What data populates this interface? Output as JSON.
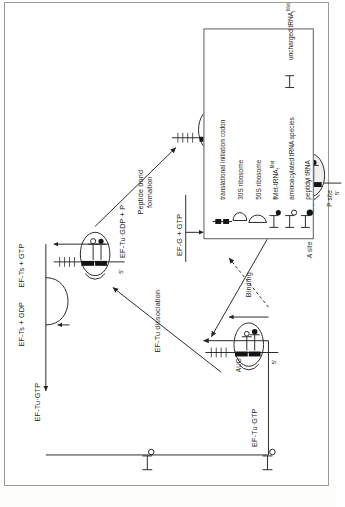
{
  "figure": {
    "orientation": "rotated-90"
  },
  "factors": {
    "ef_tu_gtp_top": "EF-Tu·GTP",
    "ef_ts_gdp": "EF-Ts + GDP",
    "ef_ts_gtp": "EF-Ts + GTP",
    "ef_tu_gdp_p": "EF-Tu·GDP + P",
    "ef_tu_gtp_left": "EF-Tu·GTP",
    "ef_g_gtp": "EF-G + GTP",
    "ef_tu_gdp_out": "EF-Tu +\nGDP"
  },
  "steps": {
    "binding": "Binding",
    "ef_tu_dissociation": "EF-Tu dissociation",
    "peptide_bond_formation": "Peptide bond\nformation",
    "translocation": "Translocation"
  },
  "ribosome_labels": {
    "aug": "AUG",
    "five_prime": "5'",
    "p_site": "P site",
    "a_site": "A site"
  },
  "legend": {
    "items": [
      {
        "symbol": "initiation-codon",
        "label": "translational initiation codon"
      },
      {
        "symbol": "30s-ribosome",
        "label": "30S ribosome"
      },
      {
        "symbol": "50s-ribosome",
        "label": "50S ribosome"
      },
      {
        "symbol": "fmet-trna",
        "label": "fMet-tRNAf Met"
      },
      {
        "symbol": "aminoacyl-trna",
        "label": "aminoacylated tRNA species"
      },
      {
        "symbol": "peptidyl-trna",
        "label": "peptidyl tRNA"
      },
      {
        "symbol": "uncharged-trna",
        "label": "uncharged tRNAf Met"
      }
    ]
  },
  "colors": {
    "ink": "#262626",
    "rule": "#5a5a5a",
    "fill_dark": "#111111",
    "paper": "#ffffff"
  }
}
